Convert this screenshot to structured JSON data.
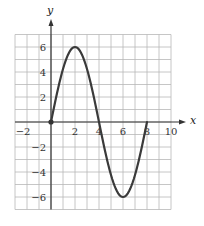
{
  "chart_data": {
    "type": "line",
    "title": "",
    "xlabel": "x",
    "ylabel": "y",
    "xlim": [
      -3,
      10
    ],
    "ylim": [
      -7,
      7
    ],
    "grid": true,
    "grid_step": 1,
    "x_ticks": [
      -2,
      2,
      4,
      6,
      8,
      10
    ],
    "x_tick_labels": [
      "−2",
      "2",
      "4",
      "6",
      "8",
      "10"
    ],
    "y_ticks": [
      6,
      4,
      2,
      -2,
      -4,
      -6
    ],
    "y_tick_labels": [
      "6",
      "4",
      "2",
      "−2",
      "−4",
      "−6"
    ],
    "series": [
      {
        "name": "curve",
        "description": "sinusoid starting at origin, max 6 at x=2, zero at x=4, min -6 at x=6, zero at x=8",
        "x": [
          0,
          1,
          2,
          3,
          4,
          5,
          6,
          7,
          8
        ],
        "y": [
          0,
          4.24,
          6,
          4.24,
          0,
          -4.24,
          -6,
          -4.24,
          0
        ],
        "color": "#3a3a3a"
      }
    ],
    "points": [
      {
        "x": 0,
        "y": 0,
        "label": "origin-point"
      }
    ],
    "legend": null
  },
  "colors": {
    "grid": "#b8b8b8",
    "axis": "#333333",
    "curve": "#3a3a3a",
    "background": "#ffffff"
  }
}
